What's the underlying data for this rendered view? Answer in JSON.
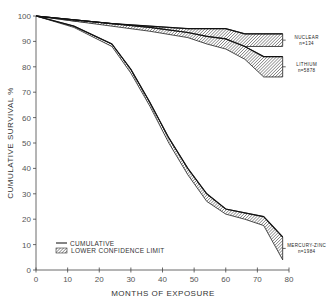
{
  "chart_data": {
    "type": "line",
    "title": "",
    "xlabel": "MONTHS OF EXPOSURE",
    "ylabel": "CUMULATIVE SURVIVAL %",
    "xlim": [
      0,
      80
    ],
    "ylim": [
      0,
      100
    ],
    "x_ticks": [
      0,
      10,
      20,
      30,
      40,
      50,
      60,
      70,
      80
    ],
    "y_ticks": [
      0,
      10,
      20,
      30,
      40,
      50,
      60,
      70,
      80,
      90,
      100
    ],
    "grid": false,
    "legend": {
      "position": "lower-left",
      "entries": [
        {
          "label": "CUMULATIVE",
          "style": "line"
        },
        {
          "label": "LOWER CONFIDENCE LIMIT",
          "style": "hatched-band"
        }
      ]
    },
    "series": [
      {
        "name": "NUCLEAR",
        "n_label": "n=134",
        "x": [
          0,
          12,
          24,
          36,
          48,
          60,
          66,
          72,
          78
        ],
        "cumulative": [
          100,
          98.5,
          97,
          96,
          95,
          95,
          93,
          93,
          93
        ],
        "lower_confidence": [
          100,
          98,
          96.5,
          94.5,
          92,
          89.5,
          88,
          88,
          88
        ]
      },
      {
        "name": "LITHIUM",
        "n_label": "n=5878",
        "x": [
          0,
          12,
          24,
          36,
          48,
          54,
          60,
          66,
          72,
          78
        ],
        "cumulative": [
          100,
          98.5,
          97,
          95.5,
          93.5,
          92,
          91,
          88,
          84,
          84
        ],
        "lower_confidence": [
          100,
          98,
          96,
          94,
          91.5,
          89,
          87,
          83,
          76,
          76
        ]
      },
      {
        "name": "MERCURY-ZINC",
        "n_label": "n=1984",
        "x": [
          0,
          12,
          24,
          30,
          36,
          42,
          48,
          54,
          60,
          66,
          72,
          78
        ],
        "cumulative": [
          100,
          96,
          89,
          79,
          66,
          52,
          40,
          30,
          24,
          22.5,
          21,
          13
        ],
        "lower_confidence": [
          100,
          95.5,
          88,
          77.5,
          64.5,
          50,
          37.5,
          27,
          22,
          20,
          17.5,
          4
        ]
      }
    ]
  }
}
